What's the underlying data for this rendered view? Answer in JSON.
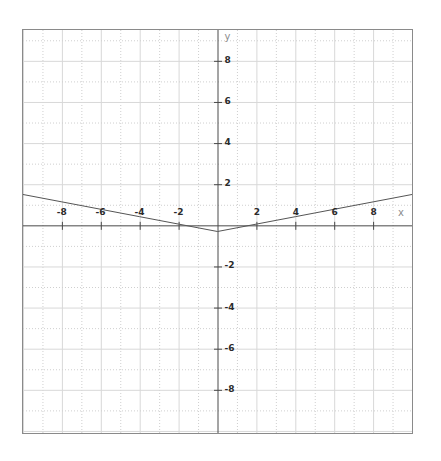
{
  "figure": {
    "background_color": "#ffffff",
    "frame_color": "#8a8a8a",
    "axis_color": "#4a4a4a",
    "curve_color": "#555555",
    "major_grid_color": "#d8d8d8",
    "minor_grid_color": "#cfcfcf",
    "tick_label_color": "#2b2b2b",
    "axis_name_color": "#8d8d8d"
  },
  "chart_data": {
    "type": "line",
    "title": "",
    "subtitle": "",
    "xlabel": "x",
    "ylabel": "y",
    "xlim": [
      -10,
      10
    ],
    "ylim": [
      -10.1,
      9.5
    ],
    "grid": true,
    "grid_major_step": 2,
    "grid_minor_step": 1,
    "legend": null,
    "legend_position": "none",
    "x_tick_labels": [
      "-8",
      "-6",
      "-4",
      "-2",
      "2",
      "4",
      "6",
      "8"
    ],
    "x_tick_values": [
      -8,
      -6,
      -4,
      -2,
      2,
      4,
      6,
      8
    ],
    "y_tick_labels": [
      "8",
      "6",
      "4",
      "2",
      "-2",
      "-4",
      "-6",
      "-8"
    ],
    "y_tick_values": [
      8,
      6,
      4,
      2,
      -2,
      -4,
      -6,
      -8
    ],
    "series": [
      {
        "name": "y = 0.18|x| - 0.3",
        "color": "#555555",
        "x": [
          -10,
          -8,
          -6,
          -4,
          -2,
          0,
          2,
          4,
          6,
          8,
          10
        ],
        "values": [
          1.5,
          1.14,
          0.78,
          0.42,
          0.06,
          -0.3,
          0.06,
          0.42,
          0.78,
          1.14,
          1.5
        ]
      }
    ],
    "annotations": [
      {
        "label": "vertex",
        "x": 0,
        "y": -0.3
      }
    ]
  },
  "axis_labels": {
    "x_axis_name": "x",
    "y_axis_name": "y"
  }
}
